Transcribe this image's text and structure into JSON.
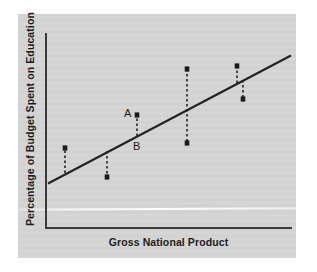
{
  "figure": {
    "panel_bg": "#d5d5d5",
    "page_bg": "#ffffff",
    "ink": "#1c1c1c",
    "axis_color": "#3a3a3a"
  },
  "chart_data": {
    "type": "scatter",
    "title": "",
    "xlabel": "Gross National Product",
    "ylabel": "Percentage of Budget Spent on Education",
    "grid": false,
    "legend": null,
    "axis_ticks": false,
    "x": [
      65,
      107,
      137,
      187,
      237,
      243
    ],
    "xlim": [
      45,
      292
    ],
    "ylim": [
      227,
      33
    ],
    "regression_line": {
      "x1": 49,
      "y1": 183,
      "x2": 290,
      "y2": 56,
      "slope_sign": "positive",
      "color": "#232323",
      "width": 2.2
    },
    "residuals": [
      {
        "id": "r1",
        "x": 65,
        "line_y": 173,
        "point_y": 148,
        "direction": "above",
        "label": null
      },
      {
        "id": "r2",
        "x": 107,
        "line_y": 151,
        "point_y": 177,
        "direction": "below",
        "label": null
      },
      {
        "id": "r3",
        "x": 137,
        "line_y": 136,
        "point_y": 115,
        "direction": "above",
        "label": "A",
        "foot_label": "B"
      },
      {
        "id": "r4",
        "x": 187,
        "line_y": 109,
        "point_y": 69,
        "point_y2": 143,
        "direction": "both",
        "label": null
      },
      {
        "id": "r5",
        "x": 237,
        "line_y": 83,
        "point_y": 66,
        "direction": "above",
        "label": null
      },
      {
        "id": "r6",
        "x": 243,
        "line_y": 80,
        "point_y": 99,
        "direction": "below",
        "label": null
      }
    ],
    "annotations": [
      {
        "text": "A",
        "x": 124,
        "y": 107,
        "describes": "observed-data-point"
      },
      {
        "text": "B",
        "x": 133,
        "y": 140,
        "describes": "predicted-point-on-line"
      }
    ]
  }
}
